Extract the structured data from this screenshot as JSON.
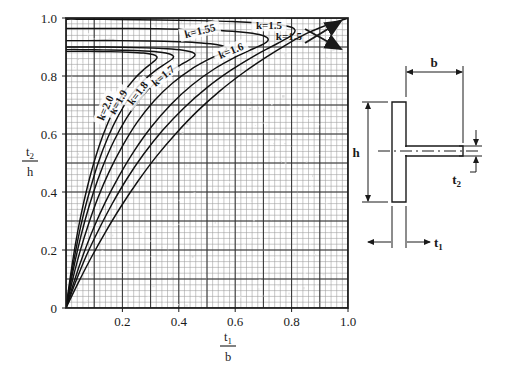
{
  "chart_data": {
    "type": "line",
    "title": "",
    "subtitle": "",
    "xlabel": "t1/b",
    "ylabel": "t2/h",
    "xlabel_num": "t",
    "xlabel_num_sub": "1",
    "xlabel_den": "b",
    "ylabel_num": "t",
    "ylabel_num_sub": "2",
    "ylabel_den": "h",
    "xlim": [
      0,
      1.0
    ],
    "ylim": [
      0,
      1.0
    ],
    "grid": true,
    "grid_minor_step": 0.02,
    "grid_major_step": 0.1,
    "xticks": [
      "0.2",
      "0.4",
      "0.6",
      "0.8",
      "1.0"
    ],
    "xtick_values": [
      0.2,
      0.4,
      0.6,
      0.8,
      1.0
    ],
    "yticks": [
      "0",
      "0.2",
      "0.4",
      "0.6",
      "0.8",
      "1.0"
    ],
    "ytick_values": [
      0,
      0.2,
      0.4,
      0.6,
      0.8,
      1.0
    ],
    "legend_position": "inline-labels",
    "annotations": [
      {
        "text": "k=1.5",
        "type": "arrow-callout",
        "arrow": "double-headed",
        "points_to": "upper-right-corner"
      }
    ],
    "series": [
      {
        "name": "k=1.5",
        "label": "k=1.5",
        "label_x": 0.72,
        "label_y": 0.975,
        "label_rotation": 0,
        "points": [
          [
            0.0,
            0.0
          ],
          [
            0.045,
            0.09
          ],
          [
            0.09,
            0.175
          ],
          [
            0.14,
            0.262
          ],
          [
            0.195,
            0.35
          ],
          [
            0.255,
            0.437
          ],
          [
            0.32,
            0.522
          ],
          [
            0.39,
            0.602
          ],
          [
            0.465,
            0.678
          ],
          [
            0.545,
            0.748
          ],
          [
            0.63,
            0.812
          ],
          [
            0.71,
            0.865
          ],
          [
            0.785,
            0.91
          ],
          [
            0.85,
            0.945
          ],
          [
            0.905,
            0.968
          ],
          [
            0.95,
            0.984
          ],
          [
            0.985,
            0.995
          ],
          [
            1.0,
            1.0
          ]
        ]
      },
      {
        "name": "k=1.55",
        "label": "k=1.55",
        "label_x": 0.475,
        "label_y": 0.955,
        "label_rotation": -14,
        "points": [
          [
            0.0,
            0.0
          ],
          [
            0.035,
            0.092
          ],
          [
            0.072,
            0.18
          ],
          [
            0.115,
            0.268
          ],
          [
            0.162,
            0.356
          ],
          [
            0.215,
            0.444
          ],
          [
            0.275,
            0.53
          ],
          [
            0.342,
            0.612
          ],
          [
            0.418,
            0.69
          ],
          [
            0.5,
            0.76
          ],
          [
            0.585,
            0.82
          ],
          [
            0.665,
            0.868
          ],
          [
            0.73,
            0.902
          ],
          [
            0.778,
            0.927
          ],
          [
            0.806,
            0.945
          ],
          [
            0.812,
            0.958
          ],
          [
            0.8,
            0.968
          ],
          [
            0.76,
            0.977
          ],
          [
            0.69,
            0.983
          ],
          [
            0.59,
            0.988
          ],
          [
            0.47,
            0.991
          ],
          [
            0.33,
            0.993
          ],
          [
            0.18,
            0.995
          ],
          [
            0.04,
            0.996
          ],
          [
            0.0,
            0.996
          ]
        ]
      },
      {
        "name": "k=1.6",
        "label": "k=1.6",
        "label_x": 0.585,
        "label_y": 0.887,
        "label_rotation": -22,
        "points": [
          [
            0.0,
            0.0
          ],
          [
            0.03,
            0.095
          ],
          [
            0.062,
            0.186
          ],
          [
            0.098,
            0.276
          ],
          [
            0.14,
            0.366
          ],
          [
            0.188,
            0.455
          ],
          [
            0.242,
            0.542
          ],
          [
            0.303,
            0.625
          ],
          [
            0.372,
            0.702
          ],
          [
            0.448,
            0.77
          ],
          [
            0.527,
            0.825
          ],
          [
            0.602,
            0.866
          ],
          [
            0.662,
            0.893
          ],
          [
            0.7,
            0.91
          ],
          [
            0.716,
            0.922
          ],
          [
            0.712,
            0.933
          ],
          [
            0.685,
            0.943
          ],
          [
            0.628,
            0.951
          ],
          [
            0.545,
            0.957
          ],
          [
            0.44,
            0.961
          ],
          [
            0.32,
            0.963
          ],
          [
            0.19,
            0.964
          ],
          [
            0.06,
            0.964
          ],
          [
            0.0,
            0.964
          ]
        ]
      },
      {
        "name": "k=1.7",
        "label": "k=1.7",
        "label_x": 0.345,
        "label_y": 0.8,
        "label_rotation": -40,
        "points": [
          [
            0.0,
            0.0
          ],
          [
            0.024,
            0.1
          ],
          [
            0.05,
            0.196
          ],
          [
            0.08,
            0.29
          ],
          [
            0.114,
            0.382
          ],
          [
            0.154,
            0.472
          ],
          [
            0.2,
            0.558
          ],
          [
            0.252,
            0.64
          ],
          [
            0.312,
            0.714
          ],
          [
            0.378,
            0.776
          ],
          [
            0.445,
            0.824
          ],
          [
            0.505,
            0.857
          ],
          [
            0.548,
            0.877
          ],
          [
            0.568,
            0.89
          ],
          [
            0.565,
            0.9
          ],
          [
            0.537,
            0.908
          ],
          [
            0.48,
            0.914
          ],
          [
            0.4,
            0.918
          ],
          [
            0.3,
            0.921
          ],
          [
            0.19,
            0.922
          ],
          [
            0.07,
            0.922
          ],
          [
            0.0,
            0.922
          ]
        ]
      },
      {
        "name": "k=1.8",
        "label": "k=1.8",
        "label_x": 0.255,
        "label_y": 0.74,
        "label_rotation": -52,
        "points": [
          [
            0.0,
            0.0
          ],
          [
            0.02,
            0.104
          ],
          [
            0.042,
            0.204
          ],
          [
            0.067,
            0.301
          ],
          [
            0.096,
            0.395
          ],
          [
            0.13,
            0.487
          ],
          [
            0.169,
            0.574
          ],
          [
            0.214,
            0.654
          ],
          [
            0.265,
            0.724
          ],
          [
            0.32,
            0.78
          ],
          [
            0.375,
            0.82
          ],
          [
            0.42,
            0.846
          ],
          [
            0.448,
            0.862
          ],
          [
            0.458,
            0.873
          ],
          [
            0.448,
            0.882
          ],
          [
            0.415,
            0.889
          ],
          [
            0.358,
            0.894
          ],
          [
            0.283,
            0.897
          ],
          [
            0.195,
            0.899
          ],
          [
            0.095,
            0.9
          ],
          [
            0.0,
            0.9
          ]
        ]
      },
      {
        "name": "k=1.9",
        "label": "k=1.9",
        "label_x": 0.185,
        "label_y": 0.71,
        "label_rotation": -60,
        "points": [
          [
            0.0,
            0.0
          ],
          [
            0.018,
            0.108
          ],
          [
            0.037,
            0.211
          ],
          [
            0.059,
            0.311
          ],
          [
            0.085,
            0.407
          ],
          [
            0.114,
            0.5
          ],
          [
            0.148,
            0.587
          ],
          [
            0.187,
            0.666
          ],
          [
            0.23,
            0.733
          ],
          [
            0.276,
            0.785
          ],
          [
            0.32,
            0.821
          ],
          [
            0.355,
            0.844
          ],
          [
            0.376,
            0.858
          ],
          [
            0.381,
            0.868
          ],
          [
            0.368,
            0.876
          ],
          [
            0.335,
            0.882
          ],
          [
            0.28,
            0.886
          ],
          [
            0.212,
            0.889
          ],
          [
            0.132,
            0.89
          ],
          [
            0.05,
            0.891
          ],
          [
            0.0,
            0.891
          ]
        ]
      },
      {
        "name": "k=2.0",
        "label": "k=2.0",
        "label_x": 0.14,
        "label_y": 0.69,
        "label_rotation": -66,
        "points": [
          [
            0.0,
            0.0
          ],
          [
            0.016,
            0.112
          ],
          [
            0.033,
            0.218
          ],
          [
            0.053,
            0.32
          ],
          [
            0.076,
            0.418
          ],
          [
            0.102,
            0.511
          ],
          [
            0.132,
            0.598
          ],
          [
            0.166,
            0.676
          ],
          [
            0.203,
            0.741
          ],
          [
            0.242,
            0.79
          ],
          [
            0.278,
            0.824
          ],
          [
            0.305,
            0.845
          ],
          [
            0.32,
            0.858
          ],
          [
            0.322,
            0.867
          ],
          [
            0.308,
            0.874
          ],
          [
            0.275,
            0.879
          ],
          [
            0.222,
            0.882
          ],
          [
            0.158,
            0.884
          ],
          [
            0.085,
            0.885
          ],
          [
            0.02,
            0.885
          ],
          [
            0.0,
            0.885
          ]
        ]
      }
    ]
  },
  "diagram": {
    "name": "t-section-cross-section",
    "dimensions": [
      {
        "key": "b",
        "label": "b",
        "sub": ""
      },
      {
        "key": "h",
        "label": "h",
        "sub": ""
      },
      {
        "key": "t2",
        "label": "t",
        "sub": "2"
      },
      {
        "key": "t1",
        "label": "t",
        "sub": "1"
      }
    ],
    "b_label": "b",
    "h_label": "h",
    "t1_label": "t",
    "t1_sub": "1",
    "t2_label": "t",
    "t2_sub": "2"
  },
  "colors": {
    "ink": "#1a1a1a",
    "grid_minor": "#8f8f8f",
    "grid_major": "#3a3a3a",
    "curve": "#111111",
    "background": "#ffffff",
    "paper_speckle": "#cfcfcf"
  }
}
